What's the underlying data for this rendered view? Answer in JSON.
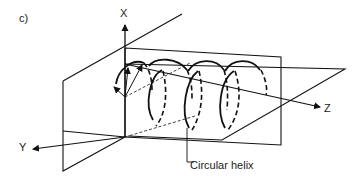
{
  "figure": {
    "panel_label": "c)",
    "axes": {
      "x": "X",
      "y": "Y",
      "z": "Z"
    },
    "callout": "Circular helix",
    "colors": {
      "line": "#111111",
      "background": "#ffffff"
    }
  }
}
